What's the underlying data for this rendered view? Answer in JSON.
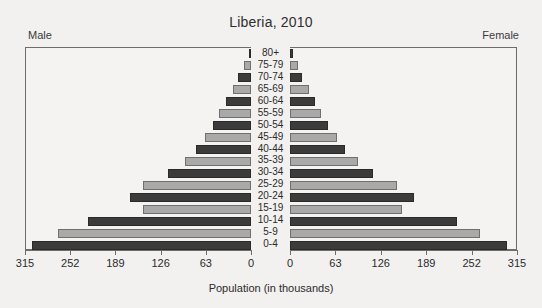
{
  "chart_data": {
    "type": "bar",
    "subtype": "population-pyramid",
    "title": "Liberia, 2010",
    "xlabel": "Population (in thousands)",
    "ylabel": "",
    "left_label": "Male",
    "right_label": "Female",
    "grid": false,
    "legend": "none",
    "axis_max": 315,
    "xticks": [
      315,
      252,
      189,
      126,
      63,
      0
    ],
    "xticks_right": [
      0,
      63,
      126,
      189,
      252,
      315
    ],
    "categories": [
      "80+",
      "75-79",
      "70-74",
      "65-69",
      "60-64",
      "55-59",
      "50-54",
      "45-49",
      "40-44",
      "35-39",
      "30-34",
      "25-29",
      "20-24",
      "15-19",
      "10-14",
      "5-9",
      "0-4"
    ],
    "series": [
      {
        "name": "Male",
        "side": "left",
        "values": [
          3,
          10,
          18,
          25,
          35,
          45,
          53,
          64,
          77,
          92,
          116,
          151,
          169,
          151,
          227,
          269,
          305
        ]
      },
      {
        "name": "Female",
        "side": "right",
        "values": [
          4,
          11,
          17,
          27,
          35,
          43,
          53,
          65,
          76,
          94,
          115,
          148,
          172,
          155,
          232,
          264,
          301
        ]
      }
    ],
    "bar_colors": {
      "dark": "#3b3b3b",
      "light": "#a9a9a9"
    },
    "background": "#f2f1ef",
    "frame_color": "#6d6d6d"
  }
}
